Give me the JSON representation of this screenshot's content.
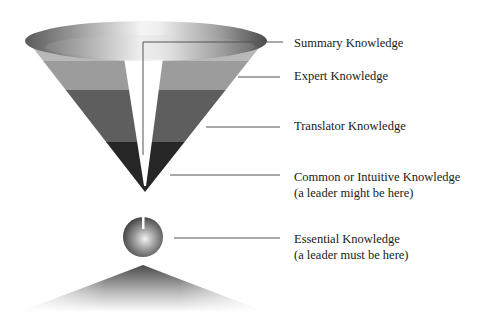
{
  "diagram": {
    "labels": [
      {
        "id": "summary",
        "line1": "Summary Knowledge",
        "line2": ""
      },
      {
        "id": "expert",
        "line1": "Expert Knowledge",
        "line2": ""
      },
      {
        "id": "translator",
        "line1": "Translator Knowledge",
        "line2": ""
      },
      {
        "id": "common",
        "line1": "Common or Intuitive Knowledge",
        "line2": "(a leader might be here)"
      },
      {
        "id": "essential",
        "line1": "Essential Knowledge",
        "line2": "(a leader must be here)"
      }
    ],
    "colors": {
      "band_light": "#9a9a9a",
      "band_mid": "#5e5e5e",
      "band_dark": "#262626",
      "leader_line": "#555555",
      "text": "#1a1a1a"
    }
  }
}
